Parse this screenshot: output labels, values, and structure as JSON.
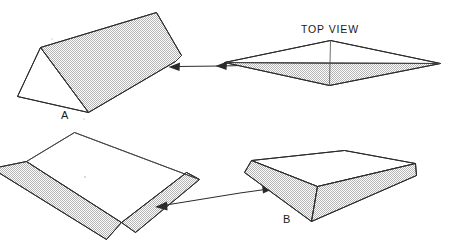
{
  "figure": {
    "title_text": "TOP VIEW",
    "labels": {
      "a": "A",
      "b": "B"
    },
    "colors": {
      "background": "#ffffff",
      "edge_stroke": "#2b2b2b",
      "shaded_fill": "#c9c9c9",
      "text": "#1a1a1a"
    },
    "shapes": [
      {
        "name": "triangular-prism-a",
        "label": "A",
        "position": "top-left",
        "description": "triangular prism, shaded slanted top face, white triangular end face"
      },
      {
        "name": "top-view-diamond",
        "label": "TOP VIEW",
        "position": "top-right",
        "description": "rhombus plan view with center vertical axis and horizontal centerline, lower half shaded"
      },
      {
        "name": "frustum-underside",
        "label": "",
        "position": "bottom-left",
        "description": "truncated pyramid seen from underneath, two shaded side faces"
      },
      {
        "name": "frustum-b",
        "label": "B",
        "position": "bottom-right",
        "description": "truncated pyramid with white flat top and two shaded side faces"
      }
    ],
    "arrows": [
      {
        "name": "arrow-top-left",
        "direction": "left",
        "from": "top-view-diamond",
        "to": "triangular-prism-a"
      },
      {
        "name": "arrow-top-right",
        "direction": "left",
        "from": "top-view-diamond",
        "to": "top-view-diamond"
      },
      {
        "name": "arrow-bottom-left",
        "direction": "left",
        "from": "frustum-b",
        "to": "frustum-underside"
      },
      {
        "name": "arrow-bottom-right",
        "direction": "right",
        "from": "frustum-underside",
        "to": "frustum-b"
      }
    ]
  }
}
